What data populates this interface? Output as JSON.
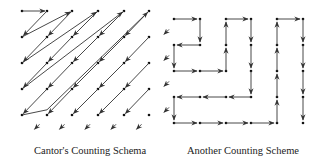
{
  "diagrams": [
    {
      "id": "cantor",
      "caption": "Cantor's Counting Schema",
      "grid": {
        "cols": 6,
        "rows": 5,
        "x": [
          22,
          47,
          72,
          98,
          124,
          149
        ],
        "y": [
          11,
          37,
          63,
          89,
          115
        ]
      },
      "path_description": "Diagonal zig-zag enumeration: (0,0)->(1,0), then diagonals down-left, returning up-right to next top point",
      "edges": [
        [
          [
            0,
            0
          ],
          [
            1,
            0
          ]
        ],
        [
          [
            1,
            0
          ],
          [
            0,
            1
          ]
        ],
        [
          [
            0,
            1
          ],
          [
            2,
            0
          ]
        ],
        [
          [
            2,
            0
          ],
          [
            1,
            1
          ]
        ],
        [
          [
            1,
            1
          ],
          [
            0,
            2
          ]
        ],
        [
          [
            0,
            2
          ],
          [
            3,
            0
          ]
        ],
        [
          [
            3,
            0
          ],
          [
            2,
            1
          ]
        ],
        [
          [
            2,
            1
          ],
          [
            1,
            2
          ]
        ],
        [
          [
            1,
            2
          ],
          [
            0,
            3
          ]
        ],
        [
          [
            0,
            3
          ],
          [
            4,
            0
          ]
        ],
        [
          [
            4,
            0
          ],
          [
            3,
            1
          ]
        ],
        [
          [
            3,
            1
          ],
          [
            2,
            2
          ]
        ],
        [
          [
            2,
            2
          ],
          [
            1,
            3
          ]
        ],
        [
          [
            1,
            3
          ],
          [
            0,
            4
          ]
        ],
        [
          [
            0,
            4
          ],
          [
            1,
            3.8
          ]
        ],
        [
          [
            1,
            3.8
          ],
          [
            5,
            0
          ]
        ],
        [
          [
            5,
            0
          ],
          [
            4,
            1
          ]
        ],
        [
          [
            4,
            1
          ],
          [
            3,
            2
          ]
        ],
        [
          [
            3,
            2
          ],
          [
            2,
            3
          ]
        ],
        [
          [
            2,
            3
          ],
          [
            1,
            4
          ]
        ],
        [
          [
            5,
            1
          ],
          [
            4,
            2
          ]
        ],
        [
          [
            4,
            2
          ],
          [
            3,
            3
          ]
        ],
        [
          [
            3,
            3
          ],
          [
            2,
            4
          ]
        ],
        [
          [
            5,
            2
          ],
          [
            4,
            3
          ]
        ],
        [
          [
            4,
            3
          ],
          [
            3,
            4
          ]
        ],
        [
          [
            5,
            3
          ],
          [
            4,
            4
          ]
        ]
      ],
      "stub_arrows_bottom": [
        [
          0.5,
          4.55
        ],
        [
          1.5,
          4.55
        ],
        [
          2.5,
          4.55
        ],
        [
          3.5,
          4.55
        ],
        [
          4.5,
          4.55
        ]
      ],
      "stub_arrows_right": [
        [
          5.6,
          0.9
        ],
        [
          5.6,
          1.9
        ],
        [
          5.6,
          2.9
        ],
        [
          5.6,
          3.9
        ]
      ]
    },
    {
      "id": "serpentine",
      "caption": "Another Counting Scheme",
      "grid": {
        "cols": 6,
        "rows": 5,
        "x": [
          174,
          200,
          226,
          251,
          277,
          303
        ],
        "y": [
          19,
          45,
          71,
          97,
          123
        ]
      },
      "path": [
        [
          0,
          0
        ],
        [
          1,
          0
        ],
        [
          1,
          1
        ],
        [
          0,
          1
        ],
        [
          0,
          2
        ],
        [
          1,
          2
        ],
        [
          2,
          2
        ],
        [
          2,
          1
        ],
        [
          2,
          0
        ],
        [
          3,
          0
        ],
        [
          3,
          1
        ],
        [
          3,
          2
        ],
        [
          3,
          3
        ],
        [
          2,
          3
        ],
        [
          1,
          3
        ],
        [
          0,
          3
        ],
        [
          0,
          4
        ],
        [
          1,
          4
        ],
        [
          2,
          4
        ],
        [
          3,
          4
        ],
        [
          4,
          4
        ],
        [
          4,
          3
        ],
        [
          4,
          2
        ],
        [
          4,
          1
        ],
        [
          4,
          0
        ],
        [
          5,
          0
        ],
        [
          5,
          1
        ],
        [
          5,
          2
        ],
        [
          5,
          3
        ],
        [
          5,
          4
        ]
      ]
    }
  ],
  "colors": {
    "stroke": "#333333",
    "dot": "#111111",
    "background": "#ffffff"
  }
}
